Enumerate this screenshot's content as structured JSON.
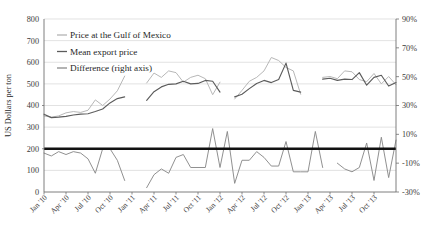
{
  "chart_data": {
    "type": "line",
    "title": "",
    "xlabel": "",
    "ylabel": "US Dollars per ton",
    "ylabel_right": "",
    "ylim": [
      0,
      800
    ],
    "ylim_right": [
      -30,
      90
    ],
    "ytick_labels": [
      "800",
      "700",
      "600",
      "500",
      "400",
      "300",
      "200",
      "100",
      "0"
    ],
    "ytick_values": [
      800,
      700,
      600,
      500,
      400,
      300,
      200,
      100,
      0
    ],
    "ytick_labels_right": [
      "90%",
      "70%",
      "50%",
      "30%",
      "10%",
      "-10%",
      "-30%"
    ],
    "ytick_values_right": [
      90,
      70,
      50,
      30,
      10,
      -10,
      -30
    ],
    "grid": true,
    "legend_position": "top-left",
    "zero_reference_line": 0,
    "x_tick_labels": [
      "Jan '10",
      "Apr '10",
      "Jul '10",
      "Oct '10",
      "Jan '11",
      "Apr '11",
      "Jul '11",
      "Oct '11",
      "Jan '12",
      "Apr '12",
      "Jul '12",
      "Oct '12",
      "Jan '13",
      "Apr '13",
      "Jul '13",
      "Oct '13"
    ],
    "x_index_of_tick": [
      0,
      3,
      6,
      9,
      12,
      15,
      18,
      21,
      24,
      27,
      30,
      33,
      36,
      39,
      42,
      45
    ],
    "colors": {
      "gulf_price": "#b3b3b3",
      "mean_export_price": "#5c5c5c",
      "difference": "#8a8a8a",
      "zero_line": "#111111",
      "gridline": "#d5d5d5",
      "axis": "#6f6f6f"
    },
    "series": [
      {
        "name": "Price at the Gulf of Mexico",
        "axis": "left",
        "color": "#b3b3b3",
        "points": [
          {
            "x": 0,
            "y": 352
          },
          {
            "x": 1,
            "y": 346
          },
          {
            "x": 2,
            "y": 352
          },
          {
            "x": 3,
            "y": 366
          },
          {
            "x": 4,
            "y": 372
          },
          {
            "x": 5,
            "y": 368
          },
          {
            "x": 6,
            "y": 378
          },
          {
            "x": 7,
            "y": 426
          },
          {
            "x": 8,
            "y": 400
          },
          {
            "x": 9,
            "y": 430
          },
          {
            "x": 10,
            "y": 468
          },
          {
            "x": 11,
            "y": 536
          },
          {
            "x": 14,
            "y": 504
          },
          {
            "x": 15,
            "y": 550
          },
          {
            "x": 16,
            "y": 530
          },
          {
            "x": 17,
            "y": 560
          },
          {
            "x": 18,
            "y": 552
          },
          {
            "x": 19,
            "y": 508
          },
          {
            "x": 20,
            "y": 530
          },
          {
            "x": 21,
            "y": 540
          },
          {
            "x": 22,
            "y": 524
          },
          {
            "x": 23,
            "y": 450
          },
          {
            "x": 24,
            "y": 508
          },
          {
            "x": 26,
            "y": 430
          },
          {
            "x": 27,
            "y": 470
          },
          {
            "x": 28,
            "y": 512
          },
          {
            "x": 29,
            "y": 530
          },
          {
            "x": 30,
            "y": 560
          },
          {
            "x": 31,
            "y": 622
          },
          {
            "x": 32,
            "y": 608
          },
          {
            "x": 33,
            "y": 576
          },
          {
            "x": 34,
            "y": 560
          },
          {
            "x": 35,
            "y": 452
          },
          {
            "x": 38,
            "y": 530
          },
          {
            "x": 39,
            "y": 534
          },
          {
            "x": 40,
            "y": 524
          },
          {
            "x": 41,
            "y": 560
          },
          {
            "x": 42,
            "y": 556
          },
          {
            "x": 43,
            "y": 520
          },
          {
            "x": 44,
            "y": 510
          },
          {
            "x": 45,
            "y": 548
          },
          {
            "x": 46,
            "y": 500
          },
          {
            "x": 47,
            "y": 534
          },
          {
            "x": 48,
            "y": 496
          }
        ]
      },
      {
        "name": "Mean export price",
        "axis": "left",
        "color": "#5c5c5c",
        "points": [
          {
            "x": 0,
            "y": 360
          },
          {
            "x": 1,
            "y": 344
          },
          {
            "x": 2,
            "y": 346
          },
          {
            "x": 3,
            "y": 350
          },
          {
            "x": 4,
            "y": 356
          },
          {
            "x": 5,
            "y": 360
          },
          {
            "x": 6,
            "y": 362
          },
          {
            "x": 7,
            "y": 372
          },
          {
            "x": 8,
            "y": 384
          },
          {
            "x": 9,
            "y": 412
          },
          {
            "x": 10,
            "y": 432
          },
          {
            "x": 11,
            "y": 440
          },
          {
            "x": 14,
            "y": 424
          },
          {
            "x": 15,
            "y": 464
          },
          {
            "x": 16,
            "y": 486
          },
          {
            "x": 17,
            "y": 498
          },
          {
            "x": 18,
            "y": 500
          },
          {
            "x": 19,
            "y": 512
          },
          {
            "x": 20,
            "y": 500
          },
          {
            "x": 21,
            "y": 502
          },
          {
            "x": 22,
            "y": 516
          },
          {
            "x": 23,
            "y": 512
          },
          {
            "x": 24,
            "y": 462
          },
          {
            "x": 26,
            "y": 440
          },
          {
            "x": 27,
            "y": 452
          },
          {
            "x": 28,
            "y": 478
          },
          {
            "x": 29,
            "y": 502
          },
          {
            "x": 30,
            "y": 516
          },
          {
            "x": 31,
            "y": 506
          },
          {
            "x": 32,
            "y": 520
          },
          {
            "x": 33,
            "y": 596
          },
          {
            "x": 34,
            "y": 470
          },
          {
            "x": 35,
            "y": 462
          },
          {
            "x": 38,
            "y": 522
          },
          {
            "x": 39,
            "y": 526
          },
          {
            "x": 40,
            "y": 516
          },
          {
            "x": 41,
            "y": 522
          },
          {
            "x": 42,
            "y": 520
          },
          {
            "x": 43,
            "y": 552
          },
          {
            "x": 44,
            "y": 494
          },
          {
            "x": 45,
            "y": 530
          },
          {
            "x": 46,
            "y": 540
          },
          {
            "x": 47,
            "y": 490
          },
          {
            "x": 48,
            "y": 506
          }
        ]
      },
      {
        "name": "Difference (right axis)",
        "axis": "right",
        "color": "#8a8a8a",
        "points": [
          {
            "x": 0,
            "y": -3
          },
          {
            "x": 1,
            "y": -5
          },
          {
            "x": 2,
            "y": -2
          },
          {
            "x": 3,
            "y": -4
          },
          {
            "x": 4,
            "y": -2
          },
          {
            "x": 5,
            "y": -3
          },
          {
            "x": 6,
            "y": -7
          },
          {
            "x": 7,
            "y": -17
          },
          {
            "x": 8,
            "y": 0
          },
          {
            "x": 9,
            "y": 0
          },
          {
            "x": 10,
            "y": -8
          },
          {
            "x": 11,
            "y": -22
          },
          {
            "x": 14,
            "y": -27
          },
          {
            "x": 15,
            "y": -18
          },
          {
            "x": 16,
            "y": -14
          },
          {
            "x": 17,
            "y": -17
          },
          {
            "x": 18,
            "y": -6
          },
          {
            "x": 19,
            "y": -4
          },
          {
            "x": 20,
            "y": -13
          },
          {
            "x": 21,
            "y": -13
          },
          {
            "x": 22,
            "y": -13
          },
          {
            "x": 23,
            "y": 14
          },
          {
            "x": 24,
            "y": -13
          },
          {
            "x": 25,
            "y": 12
          },
          {
            "x": 26,
            "y": -24
          },
          {
            "x": 27,
            "y": -8
          },
          {
            "x": 28,
            "y": -8
          },
          {
            "x": 29,
            "y": -2
          },
          {
            "x": 30,
            "y": -6
          },
          {
            "x": 31,
            "y": -12
          },
          {
            "x": 32,
            "y": -12
          },
          {
            "x": 33,
            "y": 5
          },
          {
            "x": 34,
            "y": -16
          },
          {
            "x": 35,
            "y": -16
          },
          {
            "x": 36,
            "y": -16
          },
          {
            "x": 37,
            "y": 12
          },
          {
            "x": 38,
            "y": -13
          },
          {
            "x": 40,
            "y": -10
          },
          {
            "x": 41,
            "y": -14
          },
          {
            "x": 42,
            "y": -16
          },
          {
            "x": 43,
            "y": -13
          },
          {
            "x": 44,
            "y": 4
          },
          {
            "x": 45,
            "y": -22
          },
          {
            "x": 46,
            "y": 8
          },
          {
            "x": 47,
            "y": -20
          },
          {
            "x": 48,
            "y": 6
          }
        ]
      }
    ],
    "legend": [
      {
        "label": "Price at the Gulf of Mexico",
        "color": "#b3b3b3"
      },
      {
        "label": "Mean export price",
        "color": "#5c5c5c"
      },
      {
        "label": "Difference (right axis)",
        "color": "#8a8a8a"
      }
    ]
  }
}
